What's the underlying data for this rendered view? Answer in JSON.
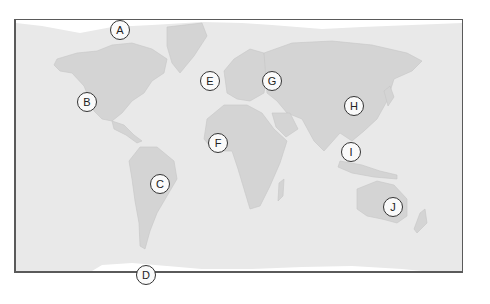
{
  "map": {
    "type": "world-outline",
    "colors": {
      "ocean": "#e9e9e9",
      "land": "#d4d4d4",
      "ice": "#ffffff",
      "frame": "#5a5a5a"
    },
    "labels": [
      {
        "id": "A",
        "text": "A",
        "x": 120,
        "y": 30,
        "region": "Arctic / Northern Canada"
      },
      {
        "id": "B",
        "text": "B",
        "x": 87,
        "y": 102,
        "region": "Western North America"
      },
      {
        "id": "C",
        "text": "C",
        "x": 160,
        "y": 184,
        "region": "South America (Brazil)"
      },
      {
        "id": "D",
        "text": "D",
        "x": 146,
        "y": 275,
        "region": "Antarctica"
      },
      {
        "id": "E",
        "text": "E",
        "x": 210,
        "y": 81,
        "region": "North Atlantic near Europe"
      },
      {
        "id": "F",
        "text": "F",
        "x": 218,
        "y": 143,
        "region": "West Africa"
      },
      {
        "id": "G",
        "text": "G",
        "x": 272,
        "y": 81,
        "region": "Russia / Eastern Europe"
      },
      {
        "id": "H",
        "text": "H",
        "x": 354,
        "y": 106,
        "region": "China"
      },
      {
        "id": "I",
        "text": "I",
        "x": 351,
        "y": 152,
        "region": "Southeast Asia"
      },
      {
        "id": "J",
        "text": "J",
        "x": 393,
        "y": 207,
        "region": "Australia"
      }
    ]
  }
}
